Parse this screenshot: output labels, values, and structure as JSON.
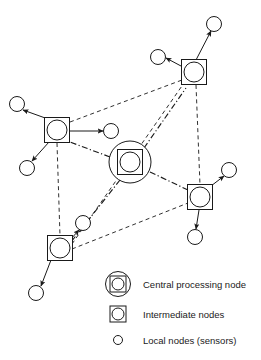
{
  "figure": {
    "background_color": "#ffffff",
    "stroke_color": "#1a1a1a",
    "node_fill": "#ffffff"
  },
  "nodes": {
    "central": [
      {
        "id": "cpn",
        "type": "central-processing-node",
        "label": "Central processing node",
        "x": 130,
        "y": 162,
        "outer_circle_r": 21,
        "square_size": 25,
        "inner_circle_r": 10
      }
    ],
    "intermediate": [
      {
        "id": "int-top-right",
        "type": "intermediate-node",
        "label": "Intermediate node (top right)",
        "x": 194,
        "y": 72,
        "square_size": 25,
        "circle_r": 10
      },
      {
        "id": "int-left",
        "type": "intermediate-node",
        "label": "Intermediate node (left)",
        "x": 57,
        "y": 130,
        "square_size": 25,
        "circle_r": 10
      },
      {
        "id": "int-right",
        "type": "intermediate-node",
        "label": "Intermediate node (right)",
        "x": 200,
        "y": 197,
        "square_size": 25,
        "circle_r": 10
      },
      {
        "id": "int-bottom-left",
        "type": "intermediate-node",
        "label": "Intermediate node (bottom left)",
        "x": 60,
        "y": 248,
        "square_size": 25,
        "circle_r": 10
      }
    ],
    "local": [
      {
        "id": "sensor-tr-up",
        "type": "local-node",
        "label": "Local node (sensor)",
        "x": 214,
        "y": 24,
        "r": 7.5
      },
      {
        "id": "sensor-tr-left",
        "type": "local-node",
        "label": "Local node (sensor)",
        "x": 158,
        "y": 57,
        "r": 7.5
      },
      {
        "id": "sensor-l-up",
        "type": "local-node",
        "label": "Local node (sensor)",
        "x": 17,
        "y": 104,
        "r": 7.5
      },
      {
        "id": "sensor-l-right",
        "type": "local-node",
        "label": "Local node (sensor)",
        "x": 111,
        "y": 131,
        "r": 7.5
      },
      {
        "id": "sensor-l-down",
        "type": "local-node",
        "label": "Local node (sensor)",
        "x": 27,
        "y": 168,
        "r": 7.5
      },
      {
        "id": "sensor-r-up",
        "type": "local-node",
        "label": "Local node (sensor)",
        "x": 229,
        "y": 170,
        "r": 7.5
      },
      {
        "id": "sensor-r-down",
        "type": "local-node",
        "label": "Local node (sensor)",
        "x": 195,
        "y": 237,
        "r": 7.5
      },
      {
        "id": "sensor-bl-up",
        "type": "local-node",
        "label": "Local node (sensor)",
        "x": 83,
        "y": 223,
        "r": 7.5
      },
      {
        "id": "sensor-bl-down",
        "type": "local-node",
        "label": "Local node (sensor)",
        "x": 36,
        "y": 293,
        "r": 7.5
      }
    ]
  },
  "links": {
    "backbone": {
      "style": "dash-dot",
      "description": "Central processing node to intermediate nodes",
      "edges": [
        {
          "from": "cpn",
          "to": "int-top-right",
          "x1": 144,
          "y1": 148,
          "x2": 186,
          "y2": 88
        },
        {
          "from": "cpn",
          "to": "int-left",
          "x1": 110,
          "y1": 157,
          "x2": 70,
          "y2": 142
        },
        {
          "from": "cpn",
          "to": "int-right",
          "x1": 150,
          "y1": 172,
          "x2": 188,
          "y2": 190
        },
        {
          "from": "cpn",
          "to": "int-bottom-left",
          "x1": 120,
          "y1": 180,
          "x2": 71,
          "y2": 242
        }
      ]
    },
    "perimeter": {
      "style": "dashed",
      "description": "Intermediate node interconnections",
      "edges": [
        {
          "from": "int-left",
          "to": "int-top-right",
          "x1": 70,
          "y1": 122,
          "x2": 182,
          "y2": 80
        },
        {
          "from": "int-left",
          "to": "int-bottom-left",
          "x1": 57,
          "y1": 143,
          "x2": 60,
          "y2": 236
        },
        {
          "from": "int-top-right",
          "to": "int-right",
          "x1": 196,
          "y1": 85,
          "x2": 200,
          "y2": 185
        },
        {
          "from": "int-bottom-left",
          "to": "int-right",
          "x1": 72,
          "y1": 249,
          "x2": 188,
          "y2": 203
        },
        {
          "from": "int-bottom-left",
          "to": "int-top-right",
          "x1": 72,
          "y1": 244,
          "x2": 184,
          "y2": 83
        }
      ]
    },
    "sensor_links": {
      "style": "solid-arrow",
      "description": "Intermediate nodes to local sensor nodes",
      "edges": [
        {
          "from": "int-top-right",
          "to": "sensor-tr-up",
          "x1": 196,
          "y1": 60,
          "x2": 211,
          "y2": 31
        },
        {
          "from": "int-top-right",
          "to": "sensor-tr-left",
          "x1": 181,
          "y1": 66,
          "x2": 166,
          "y2": 58
        },
        {
          "from": "int-left",
          "to": "sensor-l-up",
          "x1": 48,
          "y1": 119,
          "x2": 23,
          "y2": 110
        },
        {
          "from": "int-left",
          "to": "sensor-l-right",
          "x1": 70,
          "y1": 131,
          "x2": 103,
          "y2": 131
        },
        {
          "from": "int-left",
          "to": "sensor-l-down",
          "x1": 49,
          "y1": 142,
          "x2": 32,
          "y2": 161
        },
        {
          "from": "int-right",
          "to": "sensor-r-up",
          "x1": 211,
          "y1": 186,
          "x2": 224,
          "y2": 176
        },
        {
          "from": "int-right",
          "to": "sensor-r-down",
          "x1": 199,
          "y1": 210,
          "x2": 196,
          "y2": 229
        },
        {
          "from": "int-bottom-left",
          "to": "sensor-bl-up",
          "x1": 70,
          "y1": 240,
          "x2": 79,
          "y2": 230
        },
        {
          "from": "int-bottom-left",
          "to": "sensor-bl-down",
          "x1": 51,
          "y1": 260,
          "x2": 41,
          "y2": 286
        }
      ]
    }
  },
  "legend": {
    "items": [
      {
        "key": "central-processing-node",
        "label": "Central processing node",
        "symbol": "circle-square-circle",
        "icon_x": 118,
        "icon_y": 284,
        "text_x": 143,
        "text_y": 288
      },
      {
        "key": "intermediate-nodes",
        "label": "Intermediate nodes",
        "symbol": "square-circle",
        "icon_x": 118,
        "icon_y": 314,
        "text_x": 143,
        "text_y": 318
      },
      {
        "key": "local-nodes",
        "label": "Local nodes (sensors)",
        "symbol": "circle",
        "icon_x": 118,
        "icon_y": 340,
        "text_x": 143,
        "text_y": 344
      }
    ]
  }
}
